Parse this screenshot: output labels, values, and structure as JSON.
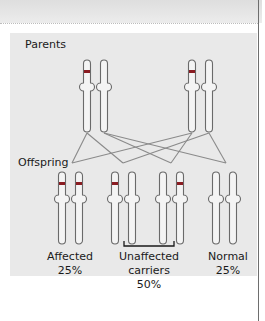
{
  "labels": {
    "parents": "Parents",
    "offspring": "Offspring"
  },
  "outcomes": [
    {
      "name": "Affected",
      "percent": "25%"
    },
    {
      "name": "Unaffected carriers",
      "name_line1": "Unaffected",
      "name_line2": "carriers",
      "percent": "50%"
    },
    {
      "name": "Normal",
      "percent": "25%"
    }
  ],
  "colors": {
    "mutant_band": "#8a1c22",
    "outline": "#6a6a6a",
    "line": "#8a8a8a",
    "panel": "#e9e9e9"
  },
  "parents": [
    {
      "id": "parent-1",
      "chromosomes": [
        "mutant",
        "normal"
      ]
    },
    {
      "id": "parent-2",
      "chromosomes": [
        "mutant",
        "normal"
      ]
    }
  ],
  "offspring": [
    {
      "group": "affected",
      "chromosomes": [
        "mutant",
        "mutant"
      ]
    },
    {
      "group": "carrier",
      "chromosomes": [
        "mutant",
        "normal"
      ]
    },
    {
      "group": "carrier",
      "chromosomes": [
        "normal",
        "mutant"
      ]
    },
    {
      "group": "normal",
      "chromosomes": [
        "normal",
        "normal"
      ]
    }
  ]
}
